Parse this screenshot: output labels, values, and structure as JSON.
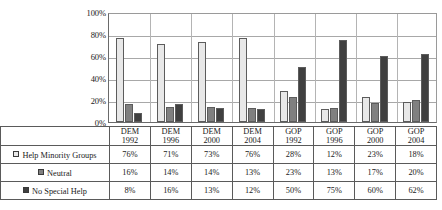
{
  "chart_data": {
    "type": "bar",
    "title": "",
    "xlabel": "",
    "ylabel": "",
    "ylim": [
      0,
      100
    ],
    "ytick_labels": [
      "100%",
      "80%",
      "60%",
      "40%",
      "20%",
      "0%"
    ],
    "ytick_values": [
      100,
      80,
      60,
      40,
      20,
      0
    ],
    "grid": true,
    "legend_position": "table-below",
    "categories": [
      "DEM 1992",
      "DEM 1996",
      "DEM 2000",
      "DEM 2004",
      "GOP 1992",
      "GOP 1996",
      "GOP 2000",
      "GOP 2004"
    ],
    "category_parts": [
      {
        "party": "DEM",
        "year": "1992"
      },
      {
        "party": "DEM",
        "year": "1996"
      },
      {
        "party": "DEM",
        "year": "2000"
      },
      {
        "party": "DEM",
        "year": "2004"
      },
      {
        "party": "GOP",
        "year": "1992"
      },
      {
        "party": "GOP",
        "year": "1996"
      },
      {
        "party": "GOP",
        "year": "2000"
      },
      {
        "party": "GOP",
        "year": "2004"
      }
    ],
    "series": [
      {
        "name": "Help Minority Groups",
        "color": "#e8e8e8",
        "values": [
          76,
          71,
          73,
          76,
          28,
          12,
          23,
          18
        ],
        "labels": [
          "76%",
          "71%",
          "73%",
          "76%",
          "28%",
          "12%",
          "23%",
          "18%"
        ]
      },
      {
        "name": "Neutral",
        "color": "#808080",
        "values": [
          16,
          14,
          14,
          13,
          23,
          13,
          17,
          20
        ],
        "labels": [
          "16%",
          "14%",
          "14%",
          "13%",
          "23%",
          "13%",
          "17%",
          "20%"
        ]
      },
      {
        "name": "No Special Help",
        "color": "#404040",
        "values": [
          8,
          16,
          13,
          12,
          50,
          75,
          60,
          62
        ],
        "labels": [
          "8%",
          "16%",
          "13%",
          "12%",
          "50%",
          "75%",
          "60%",
          "62%"
        ]
      }
    ]
  },
  "colors": {
    "series_light": "#e8e8e8",
    "series_medium": "#808080",
    "series_dark": "#404040",
    "bar_outline": "#5c5c5c",
    "gridline": "#a8a8a8",
    "axis": "#6a6a6a",
    "table_border": "#5a5a5a"
  }
}
